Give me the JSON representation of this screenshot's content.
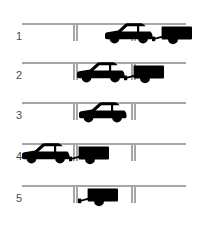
{
  "diagram": {
    "line_color": "#a6a6a6",
    "vehicle_color": "#000000",
    "label_color": "#4a4a4a",
    "background": "#ffffff",
    "kerb": {
      "line_y": 14,
      "bay_start_x": 74,
      "bay_end_x": 132,
      "tick_depth": 17,
      "tick_gap": 3,
      "line_left_x": 22,
      "line_right_x": 186
    },
    "steps": [
      {
        "label": "1",
        "label_y": 31,
        "row_top": 10,
        "car": {
          "show": true,
          "x": 103,
          "y": 10,
          "scale": 1.0
        },
        "trailer": {
          "show": true,
          "x": 152,
          "y": 14,
          "scale": 1.0
        }
      },
      {
        "label": "2",
        "label_y": 70,
        "row_top": 49,
        "car": {
          "show": true,
          "x": 75,
          "y": 10,
          "scale": 1.0
        },
        "trailer": {
          "show": true,
          "x": 124,
          "y": 14,
          "scale": 1.0
        }
      },
      {
        "label": "3",
        "label_y": 110,
        "row_top": 89,
        "car": {
          "show": true,
          "x": 77,
          "y": 10,
          "scale": 1.0
        },
        "trailer": {
          "show": false,
          "x": 0,
          "y": 0,
          "scale": 1.0
        }
      },
      {
        "label": "4",
        "label_y": 151,
        "row_top": 130,
        "car": {
          "show": true,
          "x": 20,
          "y": 10,
          "scale": 1.0
        },
        "trailer": {
          "show": true,
          "x": 69,
          "y": 14,
          "scale": 1.0
        }
      },
      {
        "label": "5",
        "label_y": 193,
        "row_top": 172,
        "car": {
          "show": false,
          "x": 0,
          "y": 0,
          "scale": 1.0
        },
        "trailer": {
          "show": true,
          "x": 78,
          "y": 14,
          "scale": 1.0
        }
      }
    ]
  }
}
